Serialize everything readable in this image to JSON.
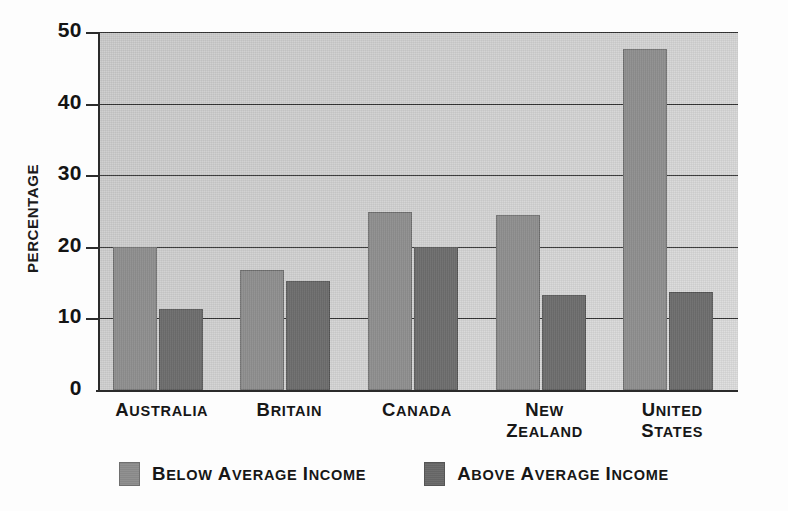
{
  "chart_data": {
    "type": "bar",
    "title": "",
    "xlabel": "",
    "ylabel": "PERCENTAGE",
    "ylim": [
      0,
      50
    ],
    "yticks": [
      0,
      10,
      20,
      30,
      40,
      50
    ],
    "ytick_labels": [
      "0",
      "10",
      "20",
      "30",
      "40",
      "50"
    ],
    "grid": true,
    "grid_axis": "y",
    "legend_position": "bottom-center",
    "categories": [
      "AUSTRALIA",
      "BRITAIN",
      "CANADA",
      "NEW ZEALAND",
      "UNITED STATES"
    ],
    "category_lines": [
      [
        "AUSTRALIA"
      ],
      [
        "BRITAIN"
      ],
      [
        "CANADA"
      ],
      [
        "NEW",
        "ZEALAND"
      ],
      [
        "UNITED",
        "STATES"
      ]
    ],
    "series": [
      {
        "name": "BELOW AVERAGE INCOME",
        "color": "#8d8d8d",
        "values": [
          20.0,
          16.8,
          24.8,
          24.5,
          47.6
        ]
      },
      {
        "name": "ABOVE AVERAGE INCOME",
        "color": "#6a6a6a",
        "values": [
          11.3,
          15.2,
          20.0,
          13.3,
          13.7
        ]
      }
    ]
  },
  "legend": {
    "items": [
      {
        "label": "BELOW AVERAGE INCOME",
        "color": "#8d8d8d",
        "swatch": "below"
      },
      {
        "label": "ABOVE AVERAGE INCOME",
        "color": "#6a6a6a",
        "swatch": "above"
      }
    ]
  },
  "colors": {
    "plot_background": "#d2d2d2",
    "axis": "#2b2b2b",
    "gridline": "#303030",
    "text": "#171717",
    "page_background": "#fdfdfd"
  }
}
